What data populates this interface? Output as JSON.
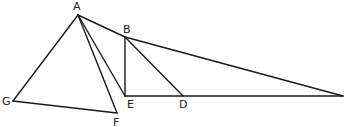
{
  "diagram": {
    "type": "geometry-figure",
    "points": [
      {
        "id": "A",
        "label": "A"
      },
      {
        "id": "B",
        "label": "B"
      },
      {
        "id": "E",
        "label": "E"
      },
      {
        "id": "D",
        "label": "D"
      },
      {
        "id": "F",
        "label": "F"
      },
      {
        "id": "G",
        "label": "G"
      },
      {
        "id": "C",
        "label": ""
      }
    ],
    "segments": [
      [
        "A",
        "G"
      ],
      [
        "G",
        "F"
      ],
      [
        "A",
        "F"
      ],
      [
        "A",
        "E"
      ],
      [
        "A",
        "B"
      ],
      [
        "B",
        "C"
      ],
      [
        "B",
        "E"
      ],
      [
        "B",
        "D"
      ],
      [
        "E",
        "C"
      ]
    ],
    "line_color": "#1a1a1a",
    "label_color": "#222222",
    "background": "#ffffff"
  }
}
